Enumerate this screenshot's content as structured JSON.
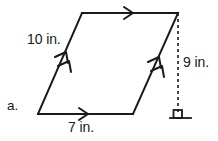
{
  "figure": {
    "item_label": "a.",
    "shape_name": "parallelogram",
    "stroke_color": "#1a1a1a",
    "background_color": "#ffffff",
    "labels": {
      "left_side": "10 in.",
      "bottom_side": "7 in.",
      "height": "9 in."
    },
    "marks": {
      "top_edge_arrow": "single-arrow-right",
      "bottom_edge_arrow": "single-arrow-right",
      "left_edge_arrow": "double-arrow-up",
      "right_edge_arrow": "double-arrow-up",
      "height_line": "dashed-vertical",
      "right_angle": "right-angle-square"
    },
    "measurements": {
      "left_side_length": "10 in.",
      "bottom_side_length": "7 in.",
      "height_length": "9 in."
    }
  }
}
